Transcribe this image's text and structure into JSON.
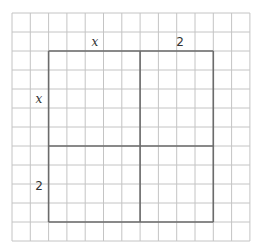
{
  "grid": {
    "origin_x": 12,
    "origin_y": 13,
    "cols": 13,
    "rows": 12,
    "cell_w": 18.3,
    "cell_h": 19,
    "line_color": "#c4c4c4"
  },
  "square": {
    "col_start": 2,
    "row_start": 2,
    "split_col": 7,
    "split_row": 7,
    "col_end": 11,
    "row_end": 11,
    "line_color": "#6b6b6b"
  },
  "labels": {
    "top_left": "x",
    "top_right": "2",
    "left_top": "x",
    "left_bottom": "2"
  }
}
